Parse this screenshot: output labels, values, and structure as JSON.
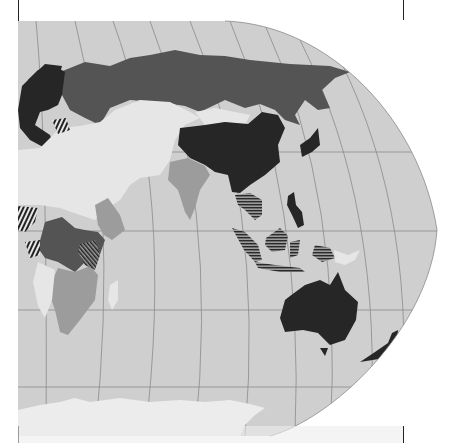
{
  "map": {
    "projection": "elliptical world map (eastern hemisphere segment)",
    "colors": {
      "ocean": "#cfcfcf",
      "graticule": "#8a8a8a",
      "category_darkest": "#262626",
      "category_dark": "#545454",
      "category_mid": "#9c9c9c",
      "category_light": "#e6e6e6",
      "antarctica": "#ececec",
      "background": "#ffffff",
      "frame": "#222222"
    },
    "regions": [
      {
        "name": "russia",
        "category": "dark"
      },
      {
        "name": "europe",
        "category": "darkest"
      },
      {
        "name": "china",
        "category": "darkest"
      },
      {
        "name": "mongolia",
        "category": "light"
      },
      {
        "name": "central-asia-middle-east-north-africa",
        "category": "light"
      },
      {
        "name": "india",
        "category": "mid"
      },
      {
        "name": "southeast-asia",
        "category": "hatched"
      },
      {
        "name": "indonesia",
        "category": "hatched"
      },
      {
        "name": "philippines",
        "category": "darkest"
      },
      {
        "name": "japan",
        "category": "darkest"
      },
      {
        "name": "australia",
        "category": "darkest"
      },
      {
        "name": "new-zealand",
        "category": "darkest"
      },
      {
        "name": "papua-new-guinea",
        "category": "light"
      },
      {
        "name": "central-africa",
        "category": "dark"
      },
      {
        "name": "east-africa",
        "category": "mid"
      },
      {
        "name": "southern-africa",
        "category": "mid"
      },
      {
        "name": "west-africa-partial",
        "category": "hatched"
      },
      {
        "name": "antarctica",
        "category": "antarctica"
      }
    ]
  }
}
